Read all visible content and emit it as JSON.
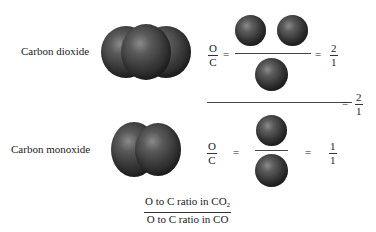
{
  "rows": [
    {
      "name": "Carbon dioxide",
      "formula_ratio": {
        "num_label": "O",
        "den_label": "C"
      },
      "equals": "=",
      "result": {
        "num": "2",
        "den": "1"
      }
    },
    {
      "name": "Carbon monoxide",
      "formula_ratio": {
        "num_label": "O",
        "den_label": "C"
      },
      "equals": "=",
      "result": {
        "num": "1",
        "den": "1"
      }
    }
  ],
  "combined_ratio": {
    "equals": "=",
    "result": {
      "num": "2",
      "den": "1"
    }
  },
  "bottom_fraction": {
    "numerator": "O to C ratio in CO",
    "numerator_sub": "2",
    "denominator": "O to C ratio in CO"
  },
  "colors": {
    "atom_dark": "#252525",
    "atom_highlight": "#8a8a8a",
    "text": "#1a1a1a"
  }
}
